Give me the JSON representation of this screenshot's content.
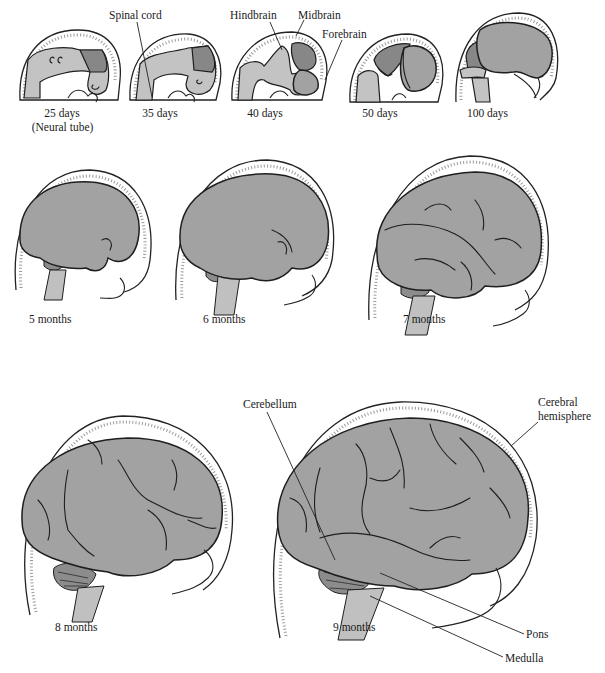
{
  "figure": {
    "row1": [
      {
        "id": "25d",
        "label": "25 days",
        "sublabel": "(Neural tube)"
      },
      {
        "id": "35d",
        "label": "35 days"
      },
      {
        "id": "40d",
        "label": "40 days"
      },
      {
        "id": "50d",
        "label": "50 days"
      },
      {
        "id": "100d",
        "label": "100 days"
      }
    ],
    "row2": [
      {
        "id": "5m",
        "label": "5 months"
      },
      {
        "id": "6m",
        "label": "6 months"
      },
      {
        "id": "7m",
        "label": "7 months"
      }
    ],
    "row3": [
      {
        "id": "8m",
        "label": "8 months"
      },
      {
        "id": "9m",
        "label": "9 months"
      }
    ],
    "callouts": {
      "spinal_cord": "Spinal cord",
      "hindbrain": "Hindbrain",
      "midbrain": "Midbrain",
      "forebrain": "Forebrain",
      "cerebellum": "Cerebellum",
      "cerebral_hemisphere_1": "Cerebral",
      "cerebral_hemisphere_2": "hemisphere",
      "pons": "Pons",
      "medulla": "Medulla"
    },
    "colors": {
      "brain_fill": "#a2a2a2",
      "brain_dark": "#878787",
      "brain_light": "#c3c3c3",
      "outline": "#1e1e1e",
      "background": "#ffffff"
    }
  }
}
